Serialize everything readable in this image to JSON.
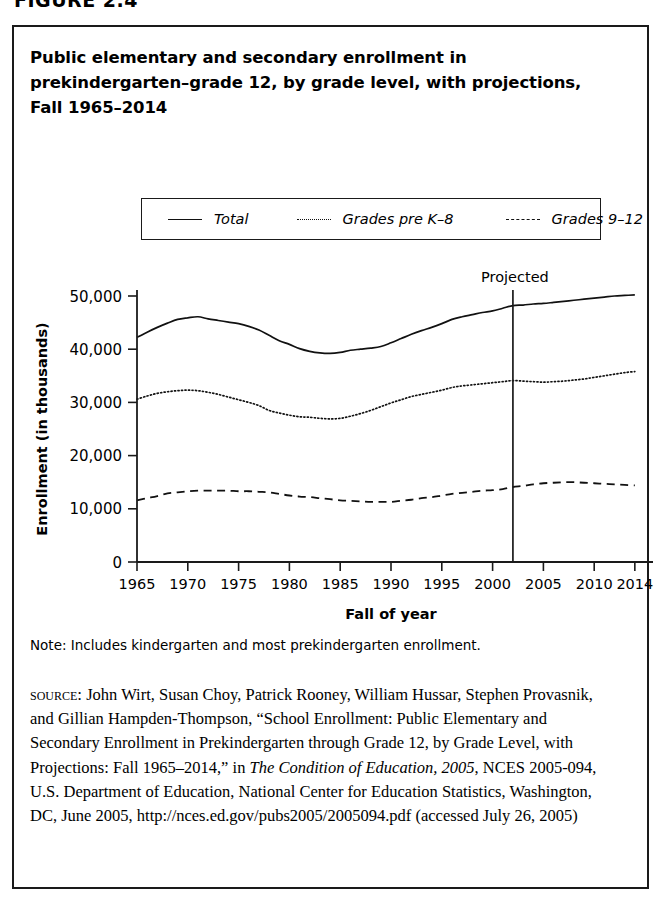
{
  "figure": {
    "number": "FIGURE 2.4",
    "title": "Public elementary and secondary enrollment in prekindergarten–grade 12, by grade level, with projections, Fall 1965–2014",
    "note": "Note: Includes kindergarten and most prekindergarten enrollment.",
    "source_label": "SOURCE:",
    "source_part1": " John Wirt, Susan Choy, Patrick Rooney, William Hussar, Stephen Provasnik, and Gillian Hampden-Thompson, “School Enrollment: Public Elementary and Secondary Enrollment in Prekindergarten through Grade 12, by Grade Level, with Projections: Fall 1965–2014,” in ",
    "source_italic": "The Condition of Education, 2005",
    "source_part2": ", NCES 2005-094, U.S. Department of Education, National Center for Education Statistics, Washington, DC, June 2005, http://nces.ed.gov/pubs2005/2005094.pdf (accessed July 26, 2005)"
  },
  "chart_data": {
    "type": "line",
    "title": "Public elementary and secondary enrollment in prekindergarten–grade 12, by grade level, with projections, Fall 1965–2014",
    "xlabel": "Fall of year",
    "ylabel": "Enrollment (in thousands)",
    "xlim": [
      1965,
      2015
    ],
    "ylim": [
      0,
      50000
    ],
    "ytick_labels": [
      "0",
      "10,000",
      "20,000",
      "30,000",
      "40,000",
      "50,000"
    ],
    "ytick_values": [
      0,
      10000,
      20000,
      30000,
      40000,
      50000
    ],
    "xtick_labels": [
      "1965",
      "1970",
      "1975",
      "1980",
      "1985",
      "1990",
      "1995",
      "2000",
      "2005",
      "2010",
      "2014"
    ],
    "xtick_values": [
      1965,
      1970,
      1975,
      1980,
      1985,
      1990,
      1995,
      2000,
      2005,
      2010,
      2014
    ],
    "grid": false,
    "legend_position": "top-center",
    "annotations": [
      {
        "text": "Projected",
        "x": 2002,
        "y": 50000,
        "type": "vline-label"
      }
    ],
    "projection_start_year": 2002,
    "x": [
      1965,
      1966,
      1967,
      1968,
      1969,
      1970,
      1971,
      1972,
      1973,
      1974,
      1975,
      1976,
      1977,
      1978,
      1979,
      1980,
      1981,
      1982,
      1983,
      1984,
      1985,
      1986,
      1987,
      1988,
      1989,
      1990,
      1991,
      1992,
      1993,
      1994,
      1995,
      1996,
      1997,
      1998,
      1999,
      2000,
      2001,
      2002,
      2003,
      2004,
      2005,
      2006,
      2007,
      2008,
      2009,
      2010,
      2011,
      2012,
      2013,
      2014
    ],
    "series": [
      {
        "name": "Total",
        "style": "solid",
        "values": [
          42200,
          43200,
          44100,
          44900,
          45600,
          45900,
          46100,
          45700,
          45400,
          45100,
          44800,
          44300,
          43600,
          42600,
          41600,
          40900,
          40100,
          39600,
          39300,
          39200,
          39400,
          39800,
          40000,
          40200,
          40500,
          41200,
          42000,
          42800,
          43500,
          44100,
          44800,
          45600,
          46100,
          46500,
          46900,
          47200,
          47700,
          48200,
          48300,
          48500,
          48600,
          48800,
          49000,
          49200,
          49400,
          49600,
          49800,
          50000,
          50100,
          50200
        ]
      },
      {
        "name": "Grades pre K–8",
        "style": "dotted",
        "values": [
          30600,
          31200,
          31700,
          32000,
          32200,
          32300,
          32200,
          31900,
          31500,
          31000,
          30500,
          30000,
          29400,
          28500,
          28000,
          27600,
          27300,
          27200,
          27000,
          26900,
          27000,
          27400,
          27900,
          28500,
          29200,
          29900,
          30500,
          31100,
          31500,
          31900,
          32300,
          32800,
          33100,
          33300,
          33500,
          33700,
          33900,
          34100,
          34000,
          33900,
          33800,
          33900,
          34000,
          34200,
          34400,
          34700,
          35000,
          35300,
          35600,
          35800
        ]
      },
      {
        "name": "Grades 9–12",
        "style": "dashed",
        "values": [
          11600,
          12000,
          12400,
          12900,
          13100,
          13300,
          13400,
          13400,
          13400,
          13400,
          13300,
          13300,
          13200,
          13100,
          12800,
          12500,
          12300,
          12200,
          12000,
          11800,
          11600,
          11500,
          11400,
          11300,
          11300,
          11300,
          11500,
          11700,
          12000,
          12200,
          12500,
          12800,
          13000,
          13200,
          13400,
          13500,
          13700,
          14100,
          14300,
          14600,
          14800,
          14900,
          15000,
          15000,
          14900,
          14800,
          14700,
          14600,
          14500,
          14400
        ]
      }
    ]
  }
}
